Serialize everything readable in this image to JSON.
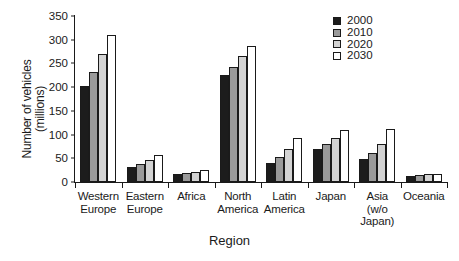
{
  "chart_data": {
    "type": "bar",
    "title": "",
    "xlabel": "Region",
    "ylabel_lines": [
      "Number of vehicles",
      "(millions)"
    ],
    "ylabel": "Number of vehicles (millions)",
    "ylim": [
      0,
      350
    ],
    "yticks": [
      0,
      50,
      100,
      150,
      200,
      250,
      300,
      350
    ],
    "ytick_labels": [
      "0",
      "50",
      "100",
      "150",
      "200",
      "250",
      "300",
      "350"
    ],
    "grid": false,
    "legend_position": "top-right",
    "categories": [
      "Western Europe",
      "Eastern Europe",
      "Africa",
      "North America",
      "Latin America",
      "Japan",
      "Asia (w/o Japan)",
      "Oceania"
    ],
    "category_label_lines": [
      [
        "Western",
        "Europe"
      ],
      [
        "Eastern",
        "Europe"
      ],
      [
        "Africa"
      ],
      [
        "North",
        "America"
      ],
      [
        "Latin",
        "America"
      ],
      [
        "Japan"
      ],
      [
        "Asia",
        "(w/o",
        "Japan)"
      ],
      [
        "Oceania"
      ]
    ],
    "series": [
      {
        "name": "2000",
        "color": "#1c1c1c",
        "values": [
          203,
          32,
          16,
          226,
          40,
          69,
          48,
          12
        ]
      },
      {
        "name": "2010",
        "color": "#9a9a9a",
        "values": [
          232,
          38,
          18,
          243,
          52,
          81,
          62,
          14
        ]
      },
      {
        "name": "2020",
        "color": "#d3d3d3",
        "values": [
          270,
          46,
          22,
          265,
          69,
          92,
          81,
          16
        ]
      },
      {
        "name": "2030",
        "color": "#ffffff",
        "values": [
          311,
          56,
          26,
          287,
          92,
          109,
          111,
          17
        ]
      }
    ]
  }
}
